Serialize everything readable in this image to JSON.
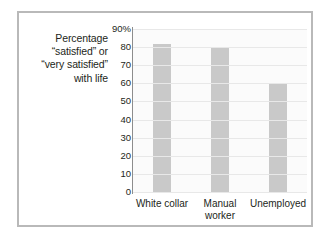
{
  "figure": {
    "frame_color": "#b9b9b9",
    "background": "#ffffff"
  },
  "axis_title": {
    "line1": "Percentage",
    "line2": "“satisfied” or",
    "line3": "“very satisfied”",
    "line4": "with life"
  },
  "chart_data": {
    "type": "bar",
    "title": "",
    "subtitle": "",
    "xlabel": "",
    "ylabel": "Percentage “satisfied” or “very satisfied” with life",
    "categories": [
      "White collar",
      "Manual worker",
      "Unemployed"
    ],
    "category_lines": [
      [
        "White collar"
      ],
      [
        "Manual",
        "worker"
      ],
      [
        "Unemployed"
      ]
    ],
    "values": [
      82,
      80,
      60
    ],
    "ylim": [
      0,
      90
    ],
    "yticks": [
      0,
      10,
      20,
      30,
      40,
      50,
      60,
      70,
      80,
      90
    ],
    "ytick_labels": [
      "0",
      "10",
      "20",
      "30",
      "40",
      "50",
      "60",
      "70",
      "80",
      "90%"
    ],
    "grid": true,
    "grid_color": "#e8e8e8",
    "legend": "none",
    "bar_color": "#c9c9c9",
    "axis_color": "#8d8d8d",
    "plot_background": "#fbfbfb"
  }
}
